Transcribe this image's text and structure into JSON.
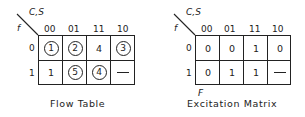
{
  "tables": [
    {
      "caption": "Flow Table",
      "corner_top": "C,S",
      "corner_left": "f",
      "col_headers": [
        "00",
        "01",
        "11",
        "10"
      ],
      "row_headers": [
        "0",
        "1"
      ],
      "cells": [
        [
          {
            "v": "1",
            "circled": true
          },
          {
            "v": "2",
            "circled": true
          },
          {
            "v": "4",
            "circled": false
          },
          {
            "v": "3",
            "circled": true
          }
        ],
        [
          {
            "v": "1",
            "circled": false
          },
          {
            "v": "5",
            "circled": true
          },
          {
            "v": "4",
            "circled": true
          },
          {
            "v": "—",
            "circled": false
          }
        ]
      ]
    },
    {
      "caption": "Excitation Matrix",
      "corner_top": "C,S",
      "corner_left": "f",
      "below_label": "F",
      "col_headers": [
        "00",
        "01",
        "11",
        "10"
      ],
      "row_headers": [
        "0",
        "1"
      ],
      "cells": [
        [
          {
            "v": "0"
          },
          {
            "v": "0"
          },
          {
            "v": "1"
          },
          {
            "v": "0"
          }
        ],
        [
          {
            "v": "0"
          },
          {
            "v": "1"
          },
          {
            "v": "1"
          },
          {
            "v": "—"
          }
        ]
      ]
    }
  ]
}
